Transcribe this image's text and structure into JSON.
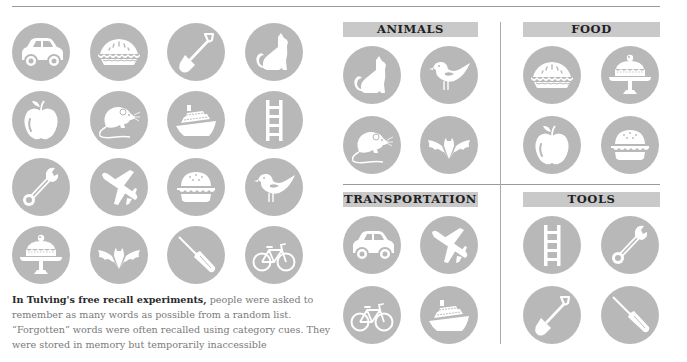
{
  "colors": {
    "circle": "#b8b8b8",
    "icon": "#ffffff",
    "header_bar": "#c9c9c9",
    "header_text": "#1f1f1f",
    "rule": "#9a9a9a",
    "caption_text": "#7a7a7a",
    "caption_bold": "#2a2a2a"
  },
  "random_list": {
    "icons": [
      [
        "car-icon",
        "pie-icon",
        "shovel-icon",
        "cat-icon"
      ],
      [
        "apple-icon",
        "mouse-icon",
        "ship-icon",
        "ladder-icon"
      ],
      [
        "wrench-icon",
        "airplane-icon",
        "burger-icon",
        "bird-icon"
      ],
      [
        "cake-icon",
        "bat-icon",
        "screwdriver-icon",
        "bicycle-icon"
      ]
    ]
  },
  "caption": {
    "lead": "In Tulving's free recall experiments,",
    "body": " people were asked to remember as many words as possible from a random list. “Forgotten” words were often recalled using category cues. They were stored in memory but temporarily inaccessible"
  },
  "categories": [
    {
      "label": "ANIMALS",
      "icons": [
        "cat-icon",
        "bird-icon",
        "mouse-icon",
        "bat-icon"
      ]
    },
    {
      "label": "FOOD",
      "icons": [
        "pie-icon",
        "cake-icon",
        "apple-icon",
        "burger-icon"
      ]
    },
    {
      "label": "TRANSPORTATION",
      "icons": [
        "car-icon",
        "airplane-icon",
        "bicycle-icon",
        "ship-icon"
      ]
    },
    {
      "label": "TOOLS",
      "icons": [
        "ladder-icon",
        "wrench-icon",
        "shovel-icon",
        "screwdriver-icon"
      ]
    }
  ]
}
